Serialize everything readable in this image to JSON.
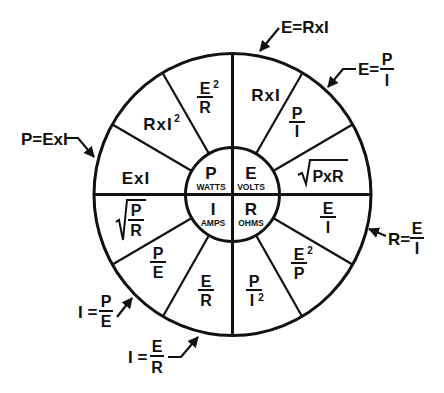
{
  "diagram": {
    "center": {
      "P": {
        "symbol": "P",
        "unit": "WATTS"
      },
      "E": {
        "symbol": "E",
        "unit": "VOLTS"
      },
      "I": {
        "symbol": "I",
        "unit": "AMPS"
      },
      "R": {
        "symbol": "R",
        "unit": "OHMS"
      }
    },
    "segments": [
      {
        "quadrant": "E",
        "formula": "RxI"
      },
      {
        "quadrant": "E",
        "num": "P",
        "den": "I"
      },
      {
        "quadrant": "E",
        "sqrt": "PxR"
      },
      {
        "quadrant": "R",
        "num": "E",
        "den": "I"
      },
      {
        "quadrant": "R",
        "num": "E",
        "num_sup": "2",
        "den": "P"
      },
      {
        "quadrant": "R",
        "num": "P",
        "den": "I",
        "den_sup": "2"
      },
      {
        "quadrant": "I",
        "num": "E",
        "den": "R"
      },
      {
        "quadrant": "I",
        "num": "P",
        "den": "E"
      },
      {
        "quadrant": "I",
        "sqrt_num": "P",
        "sqrt_den": "R"
      },
      {
        "quadrant": "P",
        "formula": "ExI"
      },
      {
        "quadrant": "P",
        "formula": "RxI",
        "formula_sup": "2"
      },
      {
        "quadrant": "P",
        "num": "E",
        "num_sup": "2",
        "den": "R"
      }
    ],
    "callouts": [
      {
        "name": "E=RxI",
        "lhs": "E=RxI"
      },
      {
        "name": "E=P/I",
        "lhs": "E=",
        "num": "P",
        "den": "I"
      },
      {
        "name": "P=ExI",
        "lhs": "P=ExI"
      },
      {
        "name": "R=E/I",
        "lhs": "R=",
        "num": "E",
        "den": "I"
      },
      {
        "name": "I=P/E",
        "lhs": "I =",
        "num": "P",
        "den": "E"
      },
      {
        "name": "I=E/R",
        "lhs": "I =",
        "num": "E",
        "den": "R"
      }
    ],
    "colors": {
      "ink": "#111111",
      "background": "#ffffff"
    }
  }
}
